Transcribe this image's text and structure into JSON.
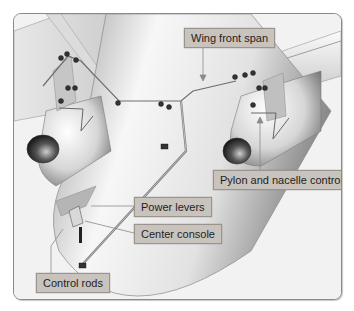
{
  "figure": {
    "style": "grayscale technical illustration",
    "labels": [
      {
        "id": "wing-front-span",
        "text": "Wing front span"
      },
      {
        "id": "pylon-nacelle-control",
        "text": "Pylon and nacelle control"
      },
      {
        "id": "power-levers",
        "text": "Power levers"
      },
      {
        "id": "center-console",
        "text": "Center console"
      },
      {
        "id": "control-rods",
        "text": "Control rods"
      }
    ]
  },
  "colors": {
    "label_fill": "#c8c3bd",
    "label_border": "#9a948e",
    "frame_border": "#8a8a8a",
    "airframe_light": "#f2f2f2",
    "airframe_shadow": "#8e8e8e"
  }
}
